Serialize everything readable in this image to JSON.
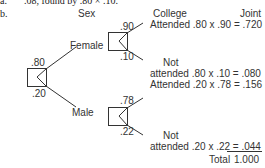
{
  "part_a": {
    "label": "a.",
    "text": ".08, found by .80 × .10."
  },
  "part_b": {
    "label": "b."
  },
  "headers": {
    "sex": "Sex",
    "college": "College",
    "joint": "Joint"
  },
  "tree": {
    "root": {
      "p_female": ".80",
      "p_male": ".20"
    },
    "female": {
      "label": "Female",
      "p_attended": ".90",
      "p_not": ".10"
    },
    "male": {
      "label": "Male",
      "p_attended": ".78",
      "p_not": ".22"
    }
  },
  "rows": [
    {
      "line1": "",
      "line2": "Attended .80 x .90 = .720"
    },
    {
      "line1": "Not",
      "line2": "attended .80 x .10 = .080"
    },
    {
      "line1": "",
      "line2": "Attended .20 x .78 = .156"
    },
    {
      "line1": "Not",
      "line2": "attended .20 x .22 = ",
      "value": ".044"
    }
  ],
  "total": {
    "label": "Total",
    "value": "1.000"
  }
}
